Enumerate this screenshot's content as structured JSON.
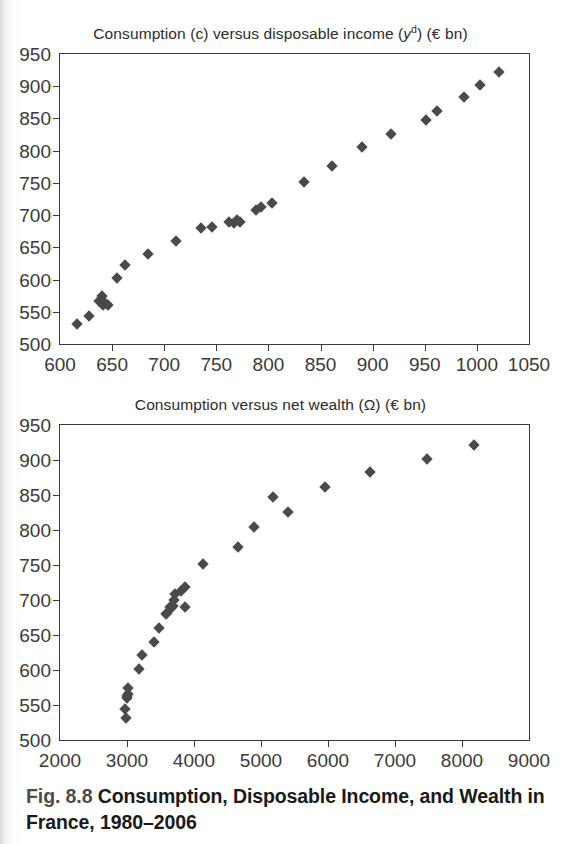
{
  "figure": {
    "caption_number": "Fig. 8.8",
    "caption_text": "Consumption, Disposable Income, and Wealth in France, 1980–2006"
  },
  "charts": [
    {
      "title_plain": "Consumption (c) versus disposable income (yᵈ) (€ bn)",
      "title_pre": "Consumption (c) versus disposable income (",
      "title_var": "y",
      "title_sup": "d",
      "title_post": ") (€ bn)"
    },
    {
      "title_plain": "Consumption versus net wealth (Ω) (€ bn)",
      "title_pre": "Consumption versus net wealth (Ω) (€ bn)",
      "title_var": "",
      "title_sup": "",
      "title_post": ""
    }
  ],
  "chart_data": [
    {
      "type": "scatter",
      "title": "Consumption (c) versus disposable income (yᵈ) (€ bn)",
      "xlabel": "",
      "ylabel": "",
      "xlim": [
        600,
        1050
      ],
      "ylim": [
        500,
        950
      ],
      "xticks": [
        600,
        650,
        700,
        750,
        800,
        850,
        900,
        950,
        1000,
        1050
      ],
      "yticks": [
        500,
        550,
        600,
        650,
        700,
        750,
        800,
        850,
        900,
        950
      ],
      "grid": false,
      "legend": "none",
      "marker": "diamond",
      "marker_color": "#4a4a4a",
      "series": [
        {
          "name": "Consumption vs disposable income",
          "points": [
            {
              "x": 616,
              "y": 531
            },
            {
              "x": 628,
              "y": 544
            },
            {
              "x": 637,
              "y": 566
            },
            {
              "x": 640,
              "y": 574
            },
            {
              "x": 641,
              "y": 561
            },
            {
              "x": 643,
              "y": 563
            },
            {
              "x": 646,
              "y": 560
            },
            {
              "x": 655,
              "y": 602
            },
            {
              "x": 662,
              "y": 622
            },
            {
              "x": 684,
              "y": 640
            },
            {
              "x": 711,
              "y": 660
            },
            {
              "x": 735,
              "y": 680
            },
            {
              "x": 746,
              "y": 681
            },
            {
              "x": 762,
              "y": 690
            },
            {
              "x": 767,
              "y": 688
            },
            {
              "x": 770,
              "y": 692
            },
            {
              "x": 773,
              "y": 690
            },
            {
              "x": 788,
              "y": 708
            },
            {
              "x": 793,
              "y": 713
            },
            {
              "x": 803,
              "y": 719
            },
            {
              "x": 834,
              "y": 751
            },
            {
              "x": 861,
              "y": 776
            },
            {
              "x": 890,
              "y": 805
            },
            {
              "x": 918,
              "y": 826
            },
            {
              "x": 951,
              "y": 847
            },
            {
              "x": 962,
              "y": 862
            },
            {
              "x": 988,
              "y": 883
            },
            {
              "x": 1003,
              "y": 902
            },
            {
              "x": 1021,
              "y": 922
            }
          ]
        }
      ]
    },
    {
      "type": "scatter",
      "title": "Consumption versus net wealth (Ω) (€ bn)",
      "xlabel": "",
      "ylabel": "",
      "xlim": [
        2000,
        9000
      ],
      "ylim": [
        500,
        950
      ],
      "xticks": [
        2000,
        3000,
        4000,
        5000,
        6000,
        7000,
        8000,
        9000
      ],
      "yticks": [
        500,
        550,
        600,
        650,
        700,
        750,
        800,
        850,
        900,
        950
      ],
      "grid": false,
      "legend": "none",
      "marker": "diamond",
      "marker_color": "#4a4a4a",
      "series": [
        {
          "name": "Consumption vs net wealth",
          "points": [
            {
              "x": 2990,
              "y": 531
            },
            {
              "x": 2975,
              "y": 544
            },
            {
              "x": 2995,
              "y": 560
            },
            {
              "x": 3000,
              "y": 563
            },
            {
              "x": 3010,
              "y": 566
            },
            {
              "x": 3020,
              "y": 574
            },
            {
              "x": 3180,
              "y": 602
            },
            {
              "x": 3230,
              "y": 622
            },
            {
              "x": 3400,
              "y": 640
            },
            {
              "x": 3480,
              "y": 660
            },
            {
              "x": 3580,
              "y": 680
            },
            {
              "x": 3600,
              "y": 681
            },
            {
              "x": 3640,
              "y": 690
            },
            {
              "x": 3660,
              "y": 688
            },
            {
              "x": 3680,
              "y": 692
            },
            {
              "x": 3700,
              "y": 700
            },
            {
              "x": 3720,
              "y": 708
            },
            {
              "x": 3800,
              "y": 713
            },
            {
              "x": 3860,
              "y": 690
            },
            {
              "x": 3870,
              "y": 719
            },
            {
              "x": 4130,
              "y": 751
            },
            {
              "x": 4650,
              "y": 776
            },
            {
              "x": 4900,
              "y": 805
            },
            {
              "x": 5400,
              "y": 826
            },
            {
              "x": 5960,
              "y": 862
            },
            {
              "x": 5180,
              "y": 847
            },
            {
              "x": 6620,
              "y": 883
            },
            {
              "x": 7480,
              "y": 902
            },
            {
              "x": 8180,
              "y": 922
            }
          ]
        }
      ]
    }
  ]
}
